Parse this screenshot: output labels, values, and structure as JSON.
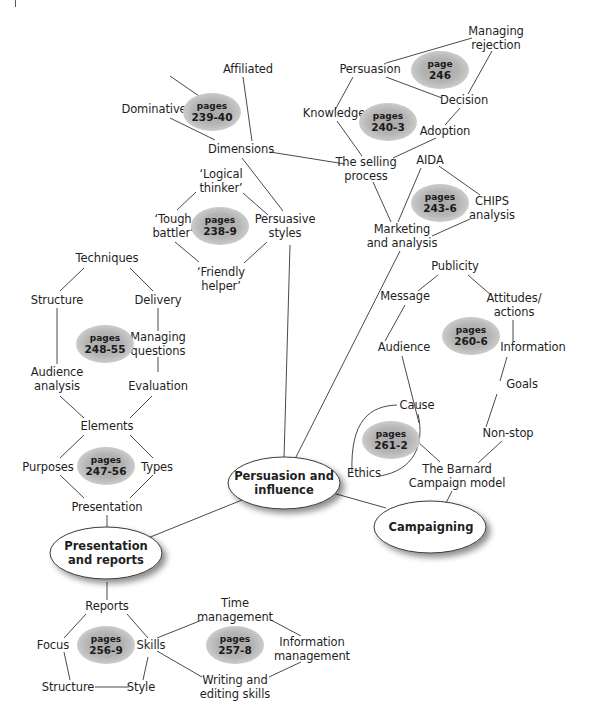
{
  "diagram": {
    "type": "mind-map",
    "hubs": {
      "persuasion": "Persuasion and\ninfluence",
      "presentation": "Presentation\nand reports",
      "campaigning": "Campaigning"
    },
    "nodes": {
      "affiliated": "Affiliated",
      "dominative": "Dominative",
      "dimensions": "Dimensions",
      "logical_thinker": "‘Logical\nthinker’",
      "tough_battler": "‘Tough\nbattler’",
      "friendly_helper": "‘Friendly\nhelper’",
      "persuasive_styles": "Persuasive\nstyles",
      "managing_rejection": "Managing\nrejection",
      "persuasion": "Persuasion",
      "decision": "Decision",
      "knowledge": "Knowledge",
      "adoption": "Adoption",
      "selling_process": "The selling\nprocess",
      "aida": "AIDA",
      "chips": "CHIPS\nanalysis",
      "marketing": "Marketing\nand analysis",
      "techniques": "Techniques",
      "structure_p": "Structure",
      "delivery": "Delivery",
      "managing_questions": "Managing\nquestions",
      "audience_analysis": "Audience\nanalysis",
      "evaluation": "Evaluation",
      "elements": "Elements",
      "purposes": "Purposes",
      "types": "Types",
      "presentation": "Presentation",
      "publicity": "Publicity",
      "message": "Message",
      "attitudes": "Attitudes/\nactions",
      "audience": "Audience",
      "information": "Information",
      "goals": "Goals",
      "cause": "Cause",
      "non_stop": "Non-stop",
      "ethics": "Ethics",
      "barnard": "The Barnard\nCampaign model",
      "reports": "Reports",
      "focus": "Focus",
      "skills": "Skills",
      "structure_r": "Structure",
      "style": "Style",
      "time_management": "Time\nmanagement",
      "information_management": "Information\nmanagement",
      "writing_skills": "Writing and\nediting skills"
    },
    "page_badges": [
      {
        "label": "pages",
        "range": "239-40"
      },
      {
        "label": "page",
        "range": "246"
      },
      {
        "label": "pages",
        "range": "240-3"
      },
      {
        "label": "pages",
        "range": "238-9"
      },
      {
        "label": "pages",
        "range": "243-6"
      },
      {
        "label": "pages",
        "range": "248-55"
      },
      {
        "label": "pages",
        "range": "260-6"
      },
      {
        "label": "pages",
        "range": "261-2"
      },
      {
        "label": "pages",
        "range": "247-56"
      },
      {
        "label": "pages",
        "range": "256-9"
      },
      {
        "label": "pages",
        "range": "257-8"
      }
    ],
    "colors": {
      "line": "#4a4a4a",
      "badge": "#b0b0b0",
      "text": "#1f1f1f",
      "hub_fill": "#ffffff"
    }
  }
}
